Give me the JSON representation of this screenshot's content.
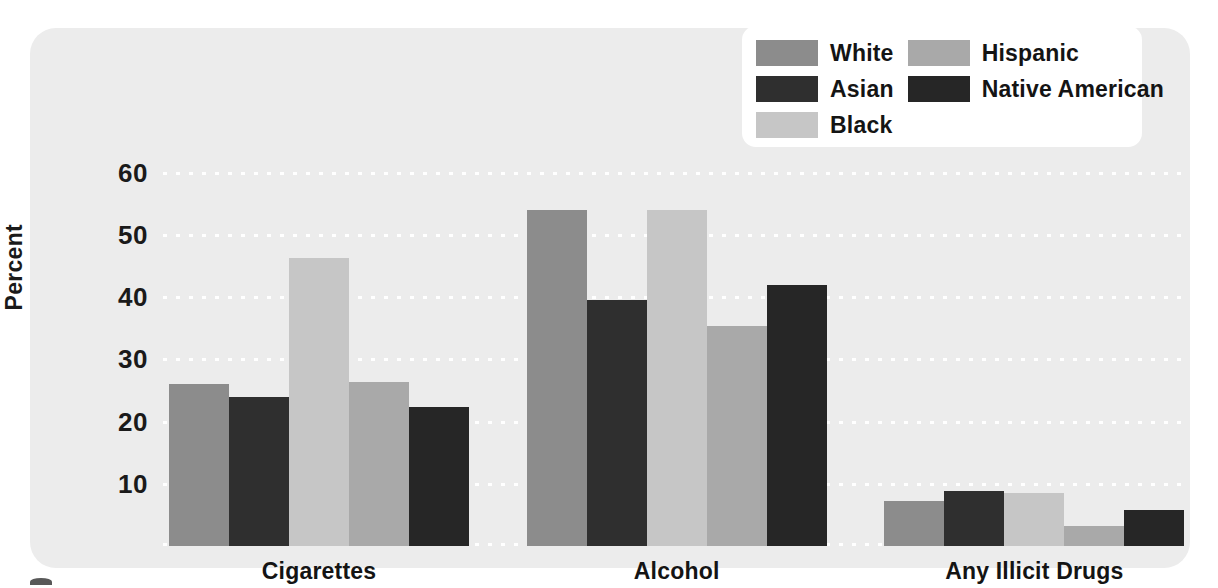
{
  "chart_data": {
    "type": "bar",
    "title": "",
    "xlabel": "",
    "ylabel": "Percent",
    "ylim": [
      0,
      63
    ],
    "yticks": [
      10,
      20,
      30,
      40,
      50,
      60
    ],
    "ytick_labels": [
      "10",
      "20",
      "30",
      "40",
      "50",
      "60"
    ],
    "grid": true,
    "grid_style": "dotted-white-horizontal",
    "legend_position": "top-right",
    "categories": [
      "Cigarettes",
      "Alcohol",
      "Any Illicit Drugs"
    ],
    "series": [
      {
        "name": "White",
        "color": "#8c8c8c",
        "values": [
          26.0,
          54.0,
          7.3
        ]
      },
      {
        "name": "Asian",
        "color": "#2f2f2f",
        "values": [
          24.0,
          39.5,
          8.8
        ]
      },
      {
        "name": "Black",
        "color": "#c6c6c6",
        "values": [
          46.3,
          54.0,
          8.5
        ]
      },
      {
        "name": "Hispanic",
        "color": "#a9a9a9",
        "values": [
          26.3,
          35.3,
          3.2
        ]
      },
      {
        "name": "Native American",
        "color": "#262626",
        "values": [
          22.3,
          42.0,
          5.8
        ]
      }
    ]
  },
  "legend": {
    "columns": [
      [
        "White",
        "Asian",
        "Black"
      ],
      [
        "Hispanic",
        "Native American"
      ]
    ]
  },
  "colors": {
    "panel_background": "#ececec",
    "legend_background": "#ffffff",
    "gridline": "#ffffff",
    "text": "#141414"
  }
}
